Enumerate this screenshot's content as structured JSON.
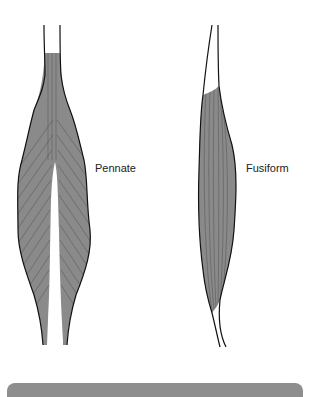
{
  "figure": {
    "muscles": [
      {
        "id": "pennate",
        "label": "Pennate"
      },
      {
        "id": "fusiform",
        "label": "Fusiform"
      }
    ],
    "colors": {
      "muscle_fill": "#8a8a8a",
      "outline": "#111111",
      "fiber": "#5a5a5a",
      "bar": "#8e8e8e"
    }
  }
}
